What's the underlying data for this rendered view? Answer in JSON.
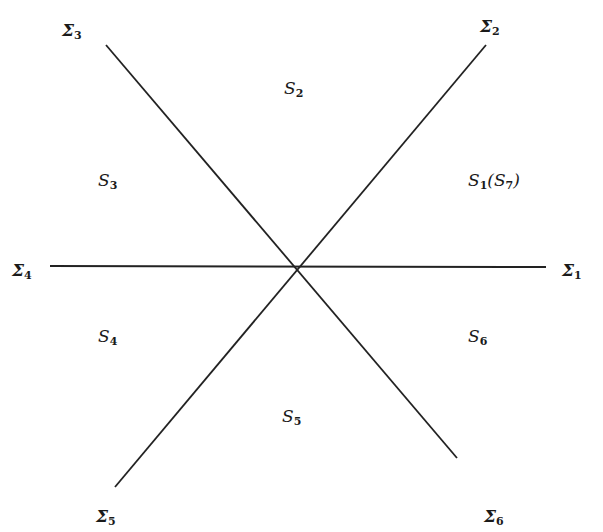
{
  "diagram": {
    "type": "stokes-sectors",
    "center": [
      298,
      266
    ],
    "rays": [
      {
        "id": "sigma1",
        "symbol": "Σ",
        "index": "1",
        "pos": [
          562,
          262
        ]
      },
      {
        "id": "sigma2",
        "symbol": "Σ",
        "index": "2",
        "pos": [
          480,
          18
        ]
      },
      {
        "id": "sigma3",
        "symbol": "Σ",
        "index": "3",
        "pos": [
          62,
          22
        ]
      },
      {
        "id": "sigma4",
        "symbol": "Σ",
        "index": "4",
        "pos": [
          12,
          262
        ]
      },
      {
        "id": "sigma5",
        "symbol": "Σ",
        "index": "5",
        "pos": [
          96,
          508
        ]
      },
      {
        "id": "sigma6",
        "symbol": "Σ",
        "index": "6",
        "pos": [
          484,
          508
        ]
      }
    ],
    "sectors": [
      {
        "id": "S1",
        "symbol": "S",
        "index": "1",
        "extra": "(S",
        "extra_index": "7",
        "close": ")",
        "pos": [
          468,
          172
        ]
      },
      {
        "id": "S2",
        "symbol": "S",
        "index": "2",
        "pos": [
          284,
          80
        ]
      },
      {
        "id": "S3",
        "symbol": "S",
        "index": "3",
        "pos": [
          98,
          172
        ]
      },
      {
        "id": "S4",
        "symbol": "S",
        "index": "4",
        "pos": [
          98,
          328
        ]
      },
      {
        "id": "S5",
        "symbol": "S",
        "index": "5",
        "pos": [
          282,
          408
        ]
      },
      {
        "id": "S6",
        "symbol": "S",
        "index": "6",
        "pos": [
          468,
          328
        ]
      }
    ],
    "line_color": "#222222"
  }
}
